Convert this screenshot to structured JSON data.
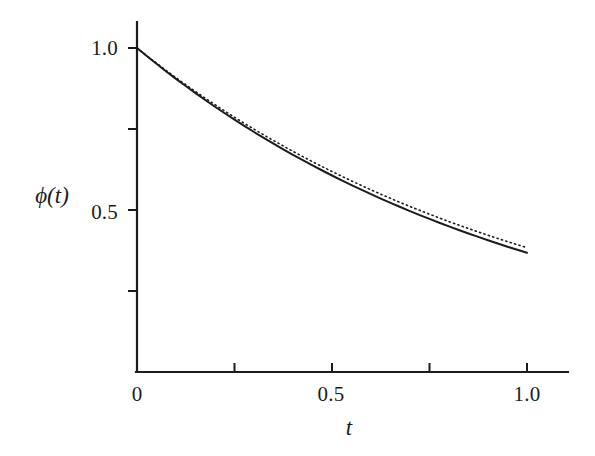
{
  "figure": {
    "background_color": "#ffffff",
    "ink_color": "#1c1c1c"
  },
  "chart_data": {
    "type": "line",
    "title": "",
    "subtitle": "",
    "xlabel": "t",
    "ylabel": "ϕ(t)",
    "xlim": [
      0,
      1.08
    ],
    "ylim": [
      0,
      1.07
    ],
    "grid": false,
    "legend": "none",
    "x_ticks": [
      0,
      0.25,
      0.5,
      0.75,
      1.0
    ],
    "x_tick_labels": [
      "0",
      "",
      "0.5",
      "",
      "1.0"
    ],
    "y_ticks": [
      0.25,
      0.5,
      0.75,
      1.0
    ],
    "y_tick_labels": [
      "",
      "0.5",
      "",
      "1.0"
    ],
    "y_origin_label": "0",
    "series": [
      {
        "name": "exact solution",
        "style": "solid",
        "color": "#1c1c1c",
        "linewidth": 2.0,
        "x": [
          0,
          0.025,
          0.05,
          0.075,
          0.1,
          0.125,
          0.15,
          0.175,
          0.2,
          0.225,
          0.25,
          0.275,
          0.3,
          0.325,
          0.35,
          0.375,
          0.4,
          0.425,
          0.45,
          0.475,
          0.5,
          0.525,
          0.55,
          0.575,
          0.6,
          0.625,
          0.65,
          0.675,
          0.7,
          0.725,
          0.75,
          0.775,
          0.8,
          0.825,
          0.85,
          0.875,
          0.9,
          0.925,
          0.95,
          0.975,
          1.0
        ],
        "y": [
          1.0,
          0.9753,
          0.9512,
          0.9277,
          0.9048,
          0.8825,
          0.8607,
          0.8395,
          0.8187,
          0.7985,
          0.7788,
          0.7596,
          0.7408,
          0.7225,
          0.7047,
          0.6873,
          0.6703,
          0.6538,
          0.6376,
          0.6219,
          0.6065,
          0.5916,
          0.5769,
          0.5627,
          0.5488,
          0.5353,
          0.522,
          0.5092,
          0.4966,
          0.4843,
          0.4724,
          0.4607,
          0.4493,
          0.4382,
          0.4274,
          0.4169,
          0.4066,
          0.3965,
          0.3867,
          0.3772,
          0.3679
        ]
      },
      {
        "name": "numerical approximation",
        "style": "dotted",
        "color": "#1c1c1c",
        "linewidth": 1.6,
        "x": [
          0,
          0.025,
          0.05,
          0.075,
          0.1,
          0.125,
          0.15,
          0.175,
          0.2,
          0.225,
          0.25,
          0.275,
          0.3,
          0.325,
          0.35,
          0.375,
          0.4,
          0.425,
          0.45,
          0.475,
          0.5,
          0.525,
          0.55,
          0.575,
          0.6,
          0.625,
          0.65,
          0.675,
          0.7,
          0.725,
          0.75,
          0.775,
          0.8,
          0.825,
          0.85,
          0.875,
          0.9,
          0.925,
          0.95,
          0.975,
          1.0
        ],
        "y": [
          1.0,
          0.9762,
          0.953,
          0.9303,
          0.9082,
          0.8866,
          0.8655,
          0.845,
          0.8249,
          0.8053,
          0.7862,
          0.7676,
          0.7494,
          0.7316,
          0.7143,
          0.6974,
          0.6809,
          0.6648,
          0.6491,
          0.6337,
          0.6187,
          0.6041,
          0.5898,
          0.5758,
          0.5622,
          0.5489,
          0.5359,
          0.5233,
          0.5109,
          0.4989,
          0.4871,
          0.4756,
          0.4643,
          0.4534,
          0.4427,
          0.4323,
          0.4221,
          0.4122,
          0.4025,
          0.393,
          0.3838
        ]
      }
    ],
    "annotations": []
  },
  "axes": {
    "y_label": "ϕ(t)",
    "x_label": "t",
    "y_tick_1": "1.0",
    "y_tick_05": "0.5",
    "x_tick_0": "0",
    "x_tick_05": "0.5",
    "x_tick_1": "1.0"
  }
}
